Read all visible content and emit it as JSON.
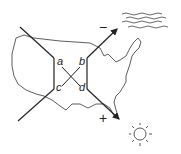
{
  "diagram": {
    "type": "quadrant-cross diagram over map",
    "background_map": "United States outline",
    "labels": {
      "a": "a",
      "b": "b",
      "c": "c",
      "d": "d"
    },
    "signs": {
      "minus": "−",
      "plus": "+"
    },
    "icons": {
      "top_right": "water-waves-icon",
      "bottom_right": "sun-icon"
    },
    "colors": {
      "line": "#222222",
      "background": "#ffffff"
    }
  }
}
